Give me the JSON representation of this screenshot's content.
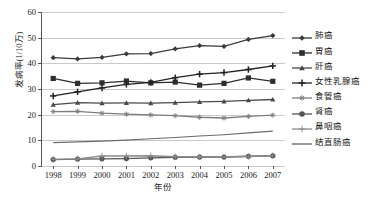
{
  "chart_data": {
    "type": "line",
    "title": "",
    "xlabel": "年份",
    "ylabel": "发病率(1/10万)",
    "x": [
      1998,
      1999,
      2000,
      2001,
      2002,
      2003,
      2004,
      2005,
      2006,
      2007
    ],
    "categories": [
      "1998",
      "1999",
      "2000",
      "2001",
      "2002",
      "2003",
      "2004",
      "2005",
      "2006",
      "2007"
    ],
    "ylim": [
      0,
      60
    ],
    "yticks": [
      0,
      10,
      20,
      30,
      40,
      50,
      60
    ],
    "ytick_labels": [
      "0",
      "10",
      "20",
      "30",
      "40",
      "50",
      "60"
    ],
    "grid": true,
    "legend_position": "right",
    "series": [
      {
        "name": "肺癌",
        "marker": "diamond",
        "color": "#3a3a3a",
        "values": [
          42.2,
          41.7,
          42.3,
          43.7,
          43.8,
          45.6,
          46.9,
          46.6,
          49.3,
          50.8
        ]
      },
      {
        "name": "胃癌",
        "marker": "square",
        "color": "#2e2e2e",
        "values": [
          34.1,
          32.2,
          32.4,
          33.1,
          32.4,
          32.7,
          31.5,
          32.2,
          34.3,
          33.0
        ]
      },
      {
        "name": "肝癌",
        "marker": "triangle",
        "color": "#4a4a4a",
        "values": [
          23.9,
          24.7,
          24.5,
          24.6,
          24.5,
          24.7,
          25.0,
          25.2,
          25.6,
          25.9
        ]
      },
      {
        "name": "女性乳腺癌",
        "marker": "plus-bold",
        "color": "#222222",
        "values": [
          27.3,
          28.9,
          30.4,
          31.8,
          32.6,
          34.4,
          35.8,
          36.4,
          37.6,
          39.0
        ]
      },
      {
        "name": "食管癌",
        "marker": "asterisk",
        "color": "#7d7d7d",
        "values": [
          21.2,
          21.3,
          20.6,
          20.2,
          19.9,
          19.6,
          19.0,
          18.7,
          19.3,
          19.8
        ]
      },
      {
        "name": "肾癌",
        "marker": "circle",
        "color": "#555555",
        "values": [
          2.5,
          2.7,
          2.8,
          2.9,
          3.2,
          3.4,
          3.5,
          3.5,
          3.8,
          4.0
        ]
      },
      {
        "name": "鼻咽癌",
        "marker": "plus-thin",
        "color": "#8a8a8a",
        "values": [
          2.6,
          2.8,
          3.9,
          3.9,
          4.0,
          3.6,
          3.5,
          3.5,
          3.7,
          4.0
        ]
      },
      {
        "name": "结直肠癌",
        "marker": "none",
        "color": "#6b6b6b",
        "values": [
          9.1,
          9.4,
          9.7,
          10.1,
          10.6,
          11.1,
          11.7,
          12.2,
          12.9,
          13.6
        ]
      }
    ]
  },
  "legend": {
    "items": [
      {
        "label": "肺癌"
      },
      {
        "label": "胃癌"
      },
      {
        "label": "肝癌"
      },
      {
        "label": "女性乳腺癌"
      },
      {
        "label": "食管癌"
      },
      {
        "label": "肾癌"
      },
      {
        "label": "鼻咽癌"
      },
      {
        "label": "结直肠癌"
      }
    ]
  }
}
